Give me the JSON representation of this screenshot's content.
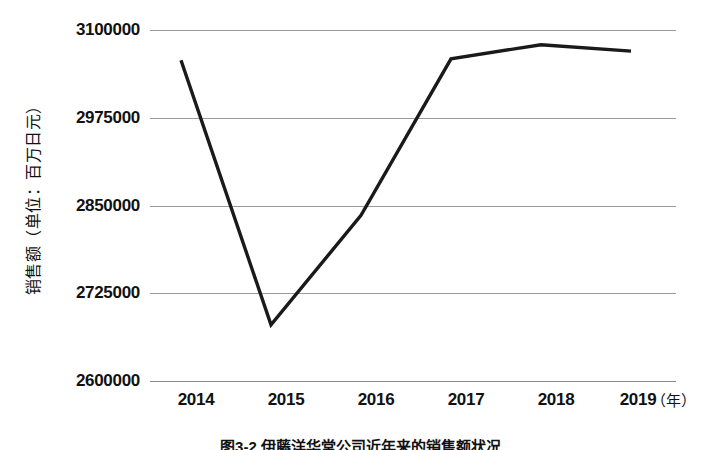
{
  "chart_data": {
    "type": "line",
    "title": "",
    "caption": "图3-2 伊藤洋华堂公司近年来的销售额状况",
    "xlabel": "（年）",
    "ylabel": "销售额（单位：百万日元）",
    "categories": [
      "2014",
      "2015",
      "2016",
      "2017",
      "2018",
      "2019"
    ],
    "values": [
      3057000,
      2680000,
      2836000,
      3059000,
      3079000,
      3070000
    ],
    "series": [
      {
        "name": "销售额",
        "values": [
          3057000,
          2680000,
          2836000,
          3059000,
          3079000,
          3070000
        ],
        "color": "#1a1a1a"
      }
    ],
    "ylim": [
      2600000,
      3100000
    ],
    "yticks": [
      2600000,
      2725000,
      2850000,
      2975000,
      3100000
    ],
    "ytick_labels": [
      "2600000",
      "2725000",
      "2850000",
      "2975000",
      "3100000"
    ],
    "xtick_labels": [
      "2014",
      "2015",
      "2016",
      "2017",
      "2018",
      "2019"
    ],
    "grid": true,
    "legend": false,
    "legend_position": "none",
    "line_color": "#1a1a1a",
    "gridline_color": "#9a9a9a",
    "background": "#ffffff"
  },
  "axes": {
    "y_title": "销售额（单位：百万日元）",
    "x_unit": "（年）",
    "y_ticks": [
      {
        "label": "3100000",
        "value": 3100000
      },
      {
        "label": "2975000",
        "value": 2975000
      },
      {
        "label": "2850000",
        "value": 2850000
      },
      {
        "label": "2725000",
        "value": 2725000
      },
      {
        "label": "2600000",
        "value": 2600000
      }
    ],
    "x_ticks": [
      {
        "label": "2014"
      },
      {
        "label": "2015"
      },
      {
        "label": "2016"
      },
      {
        "label": "2017"
      },
      {
        "label": "2018"
      },
      {
        "label": "2019"
      }
    ]
  },
  "caption": {
    "text": "图3-2 伊藤洋华堂公司近年来的销售额状况"
  }
}
